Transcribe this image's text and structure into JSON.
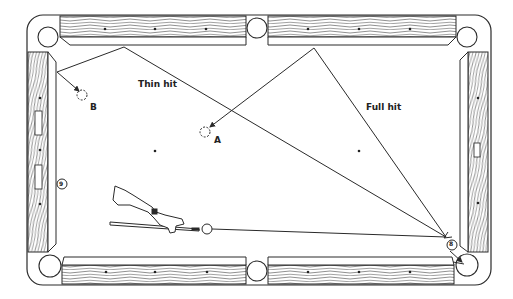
{
  "diagram": {
    "colors": {
      "ink": "#2a2a2a",
      "paper": "#ffffff"
    },
    "labels": {
      "thin_hit": "Thin hit",
      "full_hit": "Full hit",
      "ball_a": "A",
      "ball_b": "B",
      "ball_8": "8",
      "ball_9": "9"
    },
    "elements": [
      {
        "id": "cue-ball",
        "type": "ball",
        "x": 207,
        "y": 229
      },
      {
        "id": "object-ball-8",
        "type": "numbered-ball",
        "number": "8",
        "x": 452,
        "y": 245
      },
      {
        "id": "object-ball-9",
        "type": "numbered-ball",
        "number": "9",
        "x": 62,
        "y": 184
      },
      {
        "id": "ghost-ball-a",
        "type": "dashed-ball",
        "label": "A",
        "x": 205,
        "y": 132
      },
      {
        "id": "ghost-ball-b",
        "type": "dashed-ball",
        "label": "B",
        "x": 82,
        "y": 95
      }
    ],
    "paths": [
      {
        "name": "cue-to-8",
        "points": [
          [
            212,
            229
          ],
          [
            452,
            237
          ]
        ]
      },
      {
        "name": "thin-hit-path",
        "points": [
          [
            452,
            237
          ],
          [
            124,
            47
          ],
          [
            57,
            72
          ],
          [
            80,
            92
          ]
        ]
      },
      {
        "name": "full-hit-path",
        "points": [
          [
            452,
            237
          ],
          [
            314,
            48
          ],
          [
            208,
            129
          ]
        ]
      }
    ]
  }
}
